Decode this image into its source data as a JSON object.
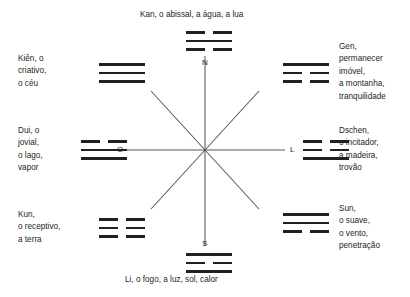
{
  "diagram": {
    "title_top": "Kan, o abissal, a água, a lua",
    "title_bottom": "Li, o fogo, a luz, sol, calor",
    "line_color": "#58595b",
    "text_color": "#231f20",
    "cardinals": {
      "north": "N",
      "south": "S",
      "east": "L",
      "west": "O"
    },
    "trigrams": [
      {
        "id": "kan",
        "position": "north",
        "lines": [
          "broken",
          "solid",
          "broken"
        ],
        "label": "Kan, o abissal, a água, a lua"
      },
      {
        "id": "kien",
        "position": "northwest",
        "lines": [
          "solid",
          "solid",
          "solid"
        ],
        "label_lines": [
          "Kiên, o",
          "criativo,",
          "o céu"
        ]
      },
      {
        "id": "gen",
        "position": "northeast",
        "lines": [
          "solid",
          "broken",
          "broken"
        ],
        "label_lines": [
          "Gen,",
          "permanecer",
          "imóvel,",
          "a montanha,",
          "tranquilidade"
        ]
      },
      {
        "id": "dui",
        "position": "west",
        "lines": [
          "broken",
          "solid",
          "solid"
        ],
        "label_lines": [
          "Dui, o",
          "jovial,",
          "o lago,",
          "vapor"
        ]
      },
      {
        "id": "dschen",
        "position": "east",
        "lines": [
          "broken",
          "broken",
          "solid"
        ],
        "label_lines": [
          "Dschen,",
          "o incitador,",
          "a madeira,",
          "trovão"
        ]
      },
      {
        "id": "kun",
        "position": "southwest",
        "lines": [
          "broken",
          "broken",
          "broken"
        ],
        "label_lines": [
          "Kun,",
          "o receptivo,",
          "a terra"
        ]
      },
      {
        "id": "sun",
        "position": "southeast",
        "lines": [
          "solid",
          "solid",
          "broken"
        ],
        "label_lines": [
          "Sun,",
          "o suave,",
          "o vento,",
          "penetração"
        ]
      },
      {
        "id": "li",
        "position": "south",
        "lines": [
          "solid",
          "broken",
          "solid"
        ],
        "label": "Li, o fogo, a luz, sol, calor"
      }
    ],
    "labels": {
      "kien": "Kiên, o\ncriativo,\no céu",
      "dui": "Dui, o\njovial,\no lago,\nvapor",
      "kun": "Kun,\no receptivo,\na terra",
      "gen": "Gen,\npermanecer\nimóvel,\na montanha,\ntranquilidade",
      "dschen": "Dschen,\no incitador,\na madeira,\ntrovão",
      "sun": "Sun,\no suave,\no vento,\npenetração"
    }
  }
}
